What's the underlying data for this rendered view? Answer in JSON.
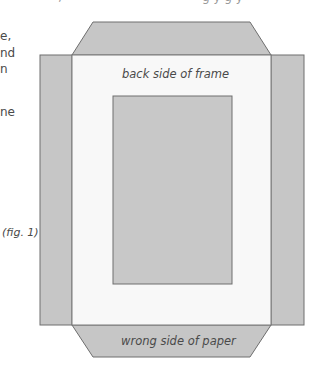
{
  "top_fragments": [
    {
      "text": "‚",
      "x": 58
    },
    {
      "text": "g y  g y",
      "x": 202
    }
  ],
  "side_text_fragments": [
    {
      "text": "e,",
      "y": 28
    },
    {
      "text": "nd",
      "y": 45
    },
    {
      "text": "n",
      "y": 61
    },
    {
      "text": "ne",
      "y": 104
    }
  ],
  "diagram": {
    "top_flap_label": "",
    "frame_label": "back side of frame",
    "bottom_flap_label": "wrong side of paper",
    "figure_caption": "(fig. 1)",
    "colors": {
      "flap_fill": "#c6c6c6",
      "flap_stroke": "#6e6e6e",
      "frame_fill": "#f8f8f8",
      "inner_fill": "#c8c8c8"
    },
    "geometry": {
      "frame": {
        "x": 72,
        "y": 55,
        "w": 199,
        "h": 270
      },
      "inner_rect": {
        "x": 113,
        "y": 96,
        "w": 119,
        "h": 188
      },
      "left_flap": {
        "x": 40,
        "y": 55,
        "w": 32,
        "h": 270
      },
      "right_flap": {
        "x": 271,
        "y": 55,
        "w": 33,
        "h": 270
      },
      "top_flap": {
        "top_y": 22,
        "bottom_y": 55,
        "top_x1": 93,
        "top_x2": 250,
        "bottom_x1": 72,
        "bottom_x2": 271
      },
      "bottom_flap": {
        "top_y": 325,
        "bottom_y": 357,
        "top_x1": 72,
        "top_x2": 271,
        "bottom_x1": 93,
        "bottom_x2": 250
      }
    }
  }
}
